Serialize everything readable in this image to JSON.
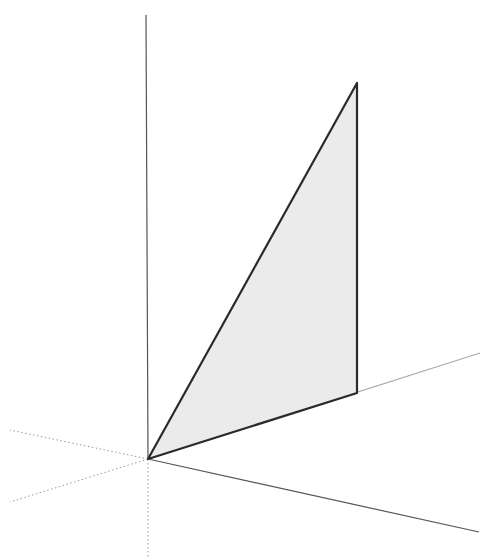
{
  "scene": {
    "description": "3D axes with a shaded right triangle in a vertical plane",
    "colors": {
      "background": "#ffffff",
      "face_fill": "#ebebeb",
      "edge": "#2a2a2a",
      "axis_solid": "#555555",
      "axis_light": "#a8a8a8",
      "axis_dotted": "#9a9a9a"
    },
    "origin": [
      148,
      459
    ],
    "axes_solid": [
      {
        "name": "vertical-axis",
        "to": [
          146,
          15
        ],
        "color": "#555555",
        "width": 1.2
      },
      {
        "name": "right-upper-axis",
        "to": [
          480,
          353
        ],
        "color": "#a8a8a8",
        "width": 1.1
      },
      {
        "name": "right-lower-axis",
        "to": [
          479,
          532
        ],
        "color": "#555555",
        "width": 1.2
      }
    ],
    "axes_dotted": [
      {
        "name": "left-upper-dotted-axis",
        "to": [
          10,
          430
        ]
      },
      {
        "name": "left-lower-dotted-axis",
        "to": [
          10,
          502
        ]
      },
      {
        "name": "down-dotted-axis",
        "to": [
          148,
          558
        ]
      }
    ],
    "triangle": {
      "points": [
        [
          148,
          459
        ],
        [
          357,
          83
        ],
        [
          357,
          393
        ]
      ]
    }
  }
}
